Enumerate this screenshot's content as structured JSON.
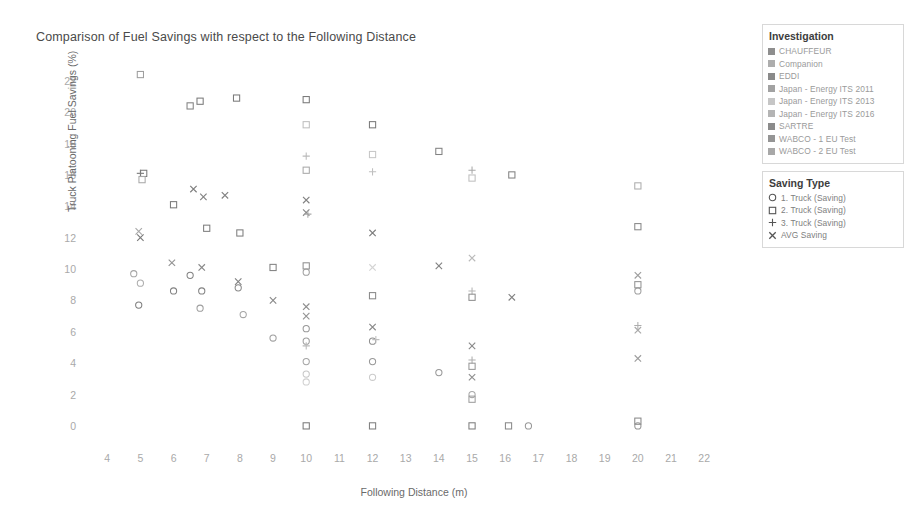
{
  "chart_data": {
    "type": "scatter",
    "title": "Comparison of Fuel Savings with respect to the Following Distance",
    "xlabel": "Following Distance (m)",
    "ylabel": "Truck Platooning Fuel Savings (%)",
    "xlim": [
      3.3,
      23.2
    ],
    "ylim": [
      -0.9,
      23.2
    ],
    "xticks": [
      4,
      5,
      6,
      7,
      8,
      9,
      10,
      11,
      12,
      13,
      14,
      15,
      16,
      17,
      18,
      19,
      20,
      21,
      22
    ],
    "yticks": [
      0,
      2,
      4,
      6,
      8,
      10,
      12,
      14,
      16,
      18,
      20,
      22
    ],
    "grid": false,
    "legend_position": "right",
    "marker_styles": {
      "1-truck": "circle",
      "2-truck": "square",
      "3-truck": "plus",
      "avg": "x"
    },
    "points": [
      {
        "x": 5.0,
        "y": 22.4,
        "marker": "square",
        "series": "Japan - Energy ITS 2011",
        "tone": 0.45
      },
      {
        "x": 5.0,
        "y": 16.1,
        "marker": "plus",
        "series": "Japan - Energy ITS 2013",
        "tone": 0.55
      },
      {
        "x": 5.1,
        "y": 16.1,
        "marker": "square",
        "series": "Japan - Energy ITS 2011",
        "tone": 0.62
      },
      {
        "x": 5.05,
        "y": 15.7,
        "marker": "square",
        "series": "Japan - Energy ITS 2016",
        "tone": 0.4
      },
      {
        "x": 4.95,
        "y": 12.4,
        "marker": "x",
        "series": "Japan - Energy ITS 2013",
        "tone": 0.4
      },
      {
        "x": 5.0,
        "y": 12.0,
        "marker": "x",
        "series": "Japan - Energy ITS 2011",
        "tone": 0.62
      },
      {
        "x": 4.8,
        "y": 9.7,
        "marker": "circle",
        "series": "Japan - Energy ITS 2013",
        "tone": 0.42
      },
      {
        "x": 5.0,
        "y": 9.1,
        "marker": "circle",
        "series": "Japan - Energy ITS 2016",
        "tone": 0.38
      },
      {
        "x": 4.95,
        "y": 7.7,
        "marker": "circle",
        "series": "Japan - Energy ITS 2011",
        "tone": 0.6
      },
      {
        "x": 6.5,
        "y": 20.4,
        "marker": "square",
        "series": "SARTRE",
        "tone": 0.58
      },
      {
        "x": 6.8,
        "y": 20.7,
        "marker": "square",
        "series": "CHAUFFEUR",
        "tone": 0.62
      },
      {
        "x": 6.6,
        "y": 15.1,
        "marker": "x",
        "series": "SARTRE",
        "tone": 0.6
      },
      {
        "x": 6.9,
        "y": 14.6,
        "marker": "x",
        "series": "CHAUFFEUR",
        "tone": 0.58
      },
      {
        "x": 6.0,
        "y": 14.1,
        "marker": "square",
        "series": "EDDI",
        "tone": 0.62
      },
      {
        "x": 5.95,
        "y": 10.4,
        "marker": "x",
        "series": "EDDI",
        "tone": 0.5
      },
      {
        "x": 6.5,
        "y": 9.6,
        "marker": "circle",
        "series": "SARTRE",
        "tone": 0.58
      },
      {
        "x": 6.85,
        "y": 10.1,
        "marker": "x",
        "series": "SARTRE",
        "tone": 0.55
      },
      {
        "x": 6.0,
        "y": 8.6,
        "marker": "circle",
        "series": "EDDI",
        "tone": 0.58
      },
      {
        "x": 6.85,
        "y": 8.6,
        "marker": "circle",
        "series": "CHAUFFEUR",
        "tone": 0.58
      },
      {
        "x": 6.8,
        "y": 7.5,
        "marker": "circle",
        "series": "SARTRE",
        "tone": 0.45
      },
      {
        "x": 7.0,
        "y": 12.6,
        "marker": "square",
        "series": "WABCO - 1 EU Test",
        "tone": 0.6
      },
      {
        "x": 7.55,
        "y": 14.7,
        "marker": "x",
        "series": "WABCO - 2 EU Test",
        "tone": 0.58
      },
      {
        "x": 7.9,
        "y": 20.9,
        "marker": "square",
        "series": "Companion",
        "tone": 0.62
      },
      {
        "x": 8.0,
        "y": 12.3,
        "marker": "square",
        "series": "Companion",
        "tone": 0.6
      },
      {
        "x": 7.95,
        "y": 9.2,
        "marker": "x",
        "series": "Companion",
        "tone": 0.58
      },
      {
        "x": 7.95,
        "y": 8.8,
        "marker": "circle",
        "series": "Companion",
        "tone": 0.55
      },
      {
        "x": 8.1,
        "y": 7.1,
        "marker": "circle",
        "series": "WABCO - 1 EU Test",
        "tone": 0.42
      },
      {
        "x": 9.0,
        "y": 10.1,
        "marker": "square",
        "series": "EDDI",
        "tone": 0.58
      },
      {
        "x": 9.0,
        "y": 8.0,
        "marker": "x",
        "series": "EDDI",
        "tone": 0.55
      },
      {
        "x": 9.0,
        "y": 5.6,
        "marker": "circle",
        "series": "EDDI",
        "tone": 0.45
      },
      {
        "x": 10.0,
        "y": 20.8,
        "marker": "square",
        "series": "CHAUFFEUR",
        "tone": 0.62
      },
      {
        "x": 10.0,
        "y": 19.2,
        "marker": "square",
        "series": "Japan - Energy ITS 2013",
        "tone": 0.3
      },
      {
        "x": 10.0,
        "y": 17.2,
        "marker": "plus",
        "series": "Japan - Energy ITS 2016",
        "tone": 0.32
      },
      {
        "x": 10.0,
        "y": 16.3,
        "marker": "square",
        "series": "SARTRE",
        "tone": 0.4
      },
      {
        "x": 10.0,
        "y": 14.4,
        "marker": "x",
        "series": "CHAUFFEUR",
        "tone": 0.58
      },
      {
        "x": 10.0,
        "y": 13.6,
        "marker": "x",
        "series": "SARTRE",
        "tone": 0.55
      },
      {
        "x": 10.05,
        "y": 13.5,
        "marker": "plus",
        "series": "Japan - Energy ITS 2011",
        "tone": 0.4
      },
      {
        "x": 10.0,
        "y": 10.2,
        "marker": "square",
        "series": "EDDI",
        "tone": 0.52
      },
      {
        "x": 10.0,
        "y": 9.8,
        "marker": "circle",
        "series": "WABCO - 1 EU Test",
        "tone": 0.45
      },
      {
        "x": 10.0,
        "y": 7.6,
        "marker": "x",
        "series": "EDDI",
        "tone": 0.52
      },
      {
        "x": 10.0,
        "y": 7.0,
        "marker": "x",
        "series": "WABCO - 2 EU Test",
        "tone": 0.5
      },
      {
        "x": 10.0,
        "y": 6.2,
        "marker": "circle",
        "series": "CHAUFFEUR",
        "tone": 0.48
      },
      {
        "x": 10.0,
        "y": 5.4,
        "marker": "circle",
        "series": "SARTRE",
        "tone": 0.45
      },
      {
        "x": 10.0,
        "y": 5.1,
        "marker": "plus",
        "series": "Japan - Energy ITS 2016",
        "tone": 0.32
      },
      {
        "x": 10.0,
        "y": 4.1,
        "marker": "circle",
        "series": "Companion",
        "tone": 0.42
      },
      {
        "x": 10.0,
        "y": 3.3,
        "marker": "circle",
        "series": "Japan - Energy ITS 2013",
        "tone": 0.26
      },
      {
        "x": 10.0,
        "y": 2.8,
        "marker": "circle",
        "series": "Japan - Energy ITS 2016",
        "tone": 0.22
      },
      {
        "x": 10.0,
        "y": 0.0,
        "marker": "square",
        "series": "WABCO - 1 EU Test",
        "tone": 0.62
      },
      {
        "x": 12.0,
        "y": 19.2,
        "marker": "square",
        "series": "CHAUFFEUR",
        "tone": 0.62
      },
      {
        "x": 12.0,
        "y": 17.3,
        "marker": "square",
        "series": "Japan - Energy ITS 2013",
        "tone": 0.26
      },
      {
        "x": 12.0,
        "y": 16.2,
        "marker": "plus",
        "series": "Japan - Energy ITS 2016",
        "tone": 0.3
      },
      {
        "x": 12.0,
        "y": 12.3,
        "marker": "x",
        "series": "CHAUFFEUR",
        "tone": 0.6
      },
      {
        "x": 12.0,
        "y": 10.1,
        "marker": "x",
        "series": "Japan - Energy ITS 2013",
        "tone": 0.2
      },
      {
        "x": 12.0,
        "y": 8.3,
        "marker": "square",
        "series": "EDDI",
        "tone": 0.55
      },
      {
        "x": 12.0,
        "y": 6.3,
        "marker": "x",
        "series": "EDDI",
        "tone": 0.55
      },
      {
        "x": 12.0,
        "y": 5.4,
        "marker": "circle",
        "series": "CHAUFFEUR",
        "tone": 0.52
      },
      {
        "x": 12.1,
        "y": 5.5,
        "marker": "plus",
        "series": "Japan - Energy ITS 2016",
        "tone": 0.3
      },
      {
        "x": 12.0,
        "y": 4.1,
        "marker": "circle",
        "series": "EDDI",
        "tone": 0.48
      },
      {
        "x": 12.0,
        "y": 3.1,
        "marker": "circle",
        "series": "Japan - Energy ITS 2013",
        "tone": 0.24
      },
      {
        "x": 12.0,
        "y": 0.0,
        "marker": "square",
        "series": "WABCO - 2 EU Test",
        "tone": 0.6
      },
      {
        "x": 14.0,
        "y": 17.5,
        "marker": "square",
        "series": "Companion",
        "tone": 0.58
      },
      {
        "x": 14.0,
        "y": 10.2,
        "marker": "x",
        "series": "Companion",
        "tone": 0.58
      },
      {
        "x": 14.0,
        "y": 3.4,
        "marker": "circle",
        "series": "Companion",
        "tone": 0.48
      },
      {
        "x": 15.0,
        "y": 16.3,
        "marker": "plus",
        "series": "Japan - Energy ITS 2016",
        "tone": 0.4
      },
      {
        "x": 15.0,
        "y": 15.8,
        "marker": "square",
        "series": "Japan - Energy ITS 2013",
        "tone": 0.3
      },
      {
        "x": 15.0,
        "y": 10.7,
        "marker": "x",
        "series": "Japan - Energy ITS 2013",
        "tone": 0.32
      },
      {
        "x": 15.0,
        "y": 8.6,
        "marker": "plus",
        "series": "Japan - Energy ITS 2016",
        "tone": 0.35
      },
      {
        "x": 15.0,
        "y": 8.2,
        "marker": "square",
        "series": "EDDI",
        "tone": 0.52
      },
      {
        "x": 15.0,
        "y": 5.1,
        "marker": "x",
        "series": "EDDI",
        "tone": 0.55
      },
      {
        "x": 15.0,
        "y": 4.2,
        "marker": "plus",
        "series": "Japan - Energy ITS 2016",
        "tone": 0.38
      },
      {
        "x": 15.0,
        "y": 3.8,
        "marker": "square",
        "series": "Japan - Energy ITS 2011",
        "tone": 0.48
      },
      {
        "x": 15.0,
        "y": 3.1,
        "marker": "x",
        "series": "Japan - Energy ITS 2011",
        "tone": 0.52
      },
      {
        "x": 15.0,
        "y": 2.0,
        "marker": "circle",
        "series": "Japan - Energy ITS 2013",
        "tone": 0.4
      },
      {
        "x": 15.0,
        "y": 1.7,
        "marker": "square",
        "series": "Japan - Energy ITS 2016",
        "tone": 0.45
      },
      {
        "x": 15.0,
        "y": 0.0,
        "marker": "square",
        "series": "EDDI",
        "tone": 0.6
      },
      {
        "x": 16.2,
        "y": 16.0,
        "marker": "square",
        "series": "Japan - Energy ITS 2011",
        "tone": 0.58
      },
      {
        "x": 16.2,
        "y": 8.2,
        "marker": "x",
        "series": "Japan - Energy ITS 2011",
        "tone": 0.58
      },
      {
        "x": 16.1,
        "y": 0.0,
        "marker": "square",
        "series": "SARTRE",
        "tone": 0.55
      },
      {
        "x": 16.7,
        "y": 0.0,
        "marker": "circle",
        "series": "SARTRE",
        "tone": 0.48
      },
      {
        "x": 20.0,
        "y": 15.3,
        "marker": "square",
        "series": "Japan - Energy ITS 2013",
        "tone": 0.38
      },
      {
        "x": 20.0,
        "y": 12.7,
        "marker": "square",
        "series": "Japan - Energy ITS 2011",
        "tone": 0.55
      },
      {
        "x": 20.0,
        "y": 9.6,
        "marker": "x",
        "series": "Japan - Energy ITS 2013",
        "tone": 0.45
      },
      {
        "x": 20.0,
        "y": 9.0,
        "marker": "square",
        "series": "EDDI",
        "tone": 0.5
      },
      {
        "x": 20.0,
        "y": 8.6,
        "marker": "circle",
        "series": "Japan - Energy ITS 2011",
        "tone": 0.45
      },
      {
        "x": 20.0,
        "y": 6.4,
        "marker": "plus",
        "series": "Japan - Energy ITS 2016",
        "tone": 0.38
      },
      {
        "x": 20.0,
        "y": 6.1,
        "marker": "x",
        "series": "EDDI",
        "tone": 0.4
      },
      {
        "x": 20.0,
        "y": 4.3,
        "marker": "x",
        "series": "Japan - Energy ITS 2016",
        "tone": 0.45
      },
      {
        "x": 20.0,
        "y": 0.3,
        "marker": "square",
        "series": "WABCO - 1 EU Test",
        "tone": 0.55
      },
      {
        "x": 20.0,
        "y": 0.0,
        "marker": "circle",
        "series": "WABCO - 2 EU Test",
        "tone": 0.5
      }
    ]
  },
  "legend": {
    "investigation": {
      "title": "Investigation",
      "items": [
        {
          "label": "CHAUFFEUR",
          "color": "#8e8e8e"
        },
        {
          "label": "Companion",
          "color": "#adadad"
        },
        {
          "label": "EDDI",
          "color": "#8a8a8a"
        },
        {
          "label": "Japan - Energy ITS 2011",
          "color": "#a2a2a2"
        },
        {
          "label": "Japan - Energy ITS 2013",
          "color": "#c6c6c6"
        },
        {
          "label": "Japan - Energy ITS 2016",
          "color": "#b4b4b4"
        },
        {
          "label": "SARTRE",
          "color": "#8b8b8b"
        },
        {
          "label": "WABCO - 1 EU Test",
          "color": "#959595"
        },
        {
          "label": "WABCO - 2 EU Test",
          "color": "#a8a8a8"
        }
      ]
    },
    "saving_type": {
      "title": "Saving Type",
      "items": [
        {
          "label": "1. Truck (Saving)",
          "marker": "circle-icon"
        },
        {
          "label": "2. Truck (Saving)",
          "marker": "square-icon"
        },
        {
          "label": "3. Truck (Saving)",
          "marker": "plus-icon"
        },
        {
          "label": "AVG Saving",
          "marker": "x-icon"
        }
      ]
    }
  }
}
